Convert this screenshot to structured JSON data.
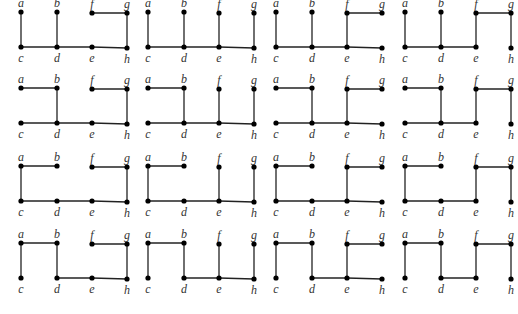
{
  "figure": {
    "rows": 4,
    "cols": 4,
    "node_labels": [
      "a",
      "b",
      "c",
      "d",
      "e",
      "f",
      "g",
      "h"
    ],
    "colors": {
      "edge": "#222222",
      "node": "#000000",
      "label": "#333333",
      "background": "#ffffff"
    }
  },
  "layout": {
    "col_offsets": [
      0,
      127,
      255,
      384
    ],
    "row_offsets": [
      0,
      76,
      154,
      231
    ],
    "node_positions": {
      "a": [
        21,
        12
      ],
      "b": [
        57,
        12
      ],
      "f": [
        92,
        13
      ],
      "g": [
        127,
        13
      ],
      "c": [
        21,
        47
      ],
      "d": [
        57,
        47
      ],
      "e": [
        92,
        47
      ],
      "h": [
        127,
        48
      ]
    }
  },
  "panels": [
    {
      "row": 0,
      "col": 0,
      "edges": [
        [
          "a",
          "c"
        ],
        [
          "b",
          "d"
        ],
        [
          "c",
          "d"
        ],
        [
          "d",
          "e"
        ],
        [
          "e",
          "h"
        ],
        [
          "g",
          "h"
        ],
        [
          "f",
          "g"
        ]
      ]
    },
    {
      "row": 0,
      "col": 1,
      "edges": [
        [
          "a",
          "c"
        ],
        [
          "b",
          "d"
        ],
        [
          "e",
          "f"
        ],
        [
          "g",
          "h"
        ],
        [
          "c",
          "d"
        ],
        [
          "d",
          "e"
        ],
        [
          "e",
          "h"
        ]
      ]
    },
    {
      "row": 0,
      "col": 2,
      "edges": [
        [
          "a",
          "c"
        ],
        [
          "b",
          "d"
        ],
        [
          "e",
          "f"
        ],
        [
          "f",
          "g"
        ],
        [
          "c",
          "d"
        ],
        [
          "d",
          "e"
        ],
        [
          "e",
          "h"
        ]
      ]
    },
    {
      "row": 0,
      "col": 3,
      "edges": [
        [
          "a",
          "c"
        ],
        [
          "b",
          "d"
        ],
        [
          "c",
          "d"
        ],
        [
          "d",
          "e"
        ],
        [
          "e",
          "f"
        ],
        [
          "f",
          "g"
        ],
        [
          "g",
          "h"
        ]
      ]
    },
    {
      "row": 1,
      "col": 0,
      "edges": [
        [
          "a",
          "b"
        ],
        [
          "b",
          "d"
        ],
        [
          "c",
          "d"
        ],
        [
          "d",
          "e"
        ],
        [
          "e",
          "h"
        ],
        [
          "g",
          "h"
        ],
        [
          "f",
          "g"
        ]
      ]
    },
    {
      "row": 1,
      "col": 1,
      "edges": [
        [
          "a",
          "b"
        ],
        [
          "b",
          "d"
        ],
        [
          "c",
          "d"
        ],
        [
          "d",
          "e"
        ],
        [
          "e",
          "f"
        ],
        [
          "e",
          "h"
        ],
        [
          "g",
          "h"
        ]
      ]
    },
    {
      "row": 1,
      "col": 2,
      "edges": [
        [
          "a",
          "b"
        ],
        [
          "b",
          "d"
        ],
        [
          "c",
          "d"
        ],
        [
          "d",
          "e"
        ],
        [
          "e",
          "f"
        ],
        [
          "f",
          "g"
        ],
        [
          "e",
          "h"
        ]
      ]
    },
    {
      "row": 1,
      "col": 3,
      "edges": [
        [
          "a",
          "b"
        ],
        [
          "b",
          "d"
        ],
        [
          "c",
          "d"
        ],
        [
          "d",
          "e"
        ],
        [
          "e",
          "f"
        ],
        [
          "f",
          "g"
        ],
        [
          "g",
          "h"
        ]
      ]
    },
    {
      "row": 2,
      "col": 0,
      "edges": [
        [
          "a",
          "b"
        ],
        [
          "a",
          "c"
        ],
        [
          "c",
          "d"
        ],
        [
          "d",
          "e"
        ],
        [
          "e",
          "h"
        ],
        [
          "g",
          "h"
        ],
        [
          "f",
          "g"
        ]
      ]
    },
    {
      "row": 2,
      "col": 1,
      "edges": [
        [
          "a",
          "b"
        ],
        [
          "a",
          "c"
        ],
        [
          "c",
          "d"
        ],
        [
          "d",
          "e"
        ],
        [
          "e",
          "f"
        ],
        [
          "e",
          "h"
        ],
        [
          "g",
          "h"
        ]
      ]
    },
    {
      "row": 2,
      "col": 2,
      "edges": [
        [
          "a",
          "b"
        ],
        [
          "a",
          "c"
        ],
        [
          "c",
          "d"
        ],
        [
          "d",
          "e"
        ],
        [
          "e",
          "f"
        ],
        [
          "f",
          "g"
        ],
        [
          "e",
          "h"
        ]
      ]
    },
    {
      "row": 2,
      "col": 3,
      "edges": [
        [
          "a",
          "b"
        ],
        [
          "a",
          "c"
        ],
        [
          "c",
          "d"
        ],
        [
          "d",
          "e"
        ],
        [
          "e",
          "f"
        ],
        [
          "f",
          "g"
        ],
        [
          "g",
          "h"
        ]
      ]
    },
    {
      "row": 3,
      "col": 0,
      "edges": [
        [
          "a",
          "b"
        ],
        [
          "a",
          "c"
        ],
        [
          "b",
          "d"
        ],
        [
          "d",
          "e"
        ],
        [
          "e",
          "h"
        ],
        [
          "g",
          "h"
        ],
        [
          "f",
          "g"
        ]
      ]
    },
    {
      "row": 3,
      "col": 1,
      "edges": [
        [
          "a",
          "b"
        ],
        [
          "a",
          "c"
        ],
        [
          "b",
          "d"
        ],
        [
          "d",
          "e"
        ],
        [
          "e",
          "f"
        ],
        [
          "e",
          "h"
        ],
        [
          "g",
          "h"
        ]
      ]
    },
    {
      "row": 3,
      "col": 2,
      "edges": [
        [
          "a",
          "b"
        ],
        [
          "a",
          "c"
        ],
        [
          "b",
          "d"
        ],
        [
          "d",
          "e"
        ],
        [
          "e",
          "f"
        ],
        [
          "f",
          "g"
        ],
        [
          "e",
          "h"
        ]
      ]
    },
    {
      "row": 3,
      "col": 3,
      "edges": [
        [
          "a",
          "b"
        ],
        [
          "a",
          "c"
        ],
        [
          "b",
          "d"
        ],
        [
          "d",
          "e"
        ],
        [
          "e",
          "f"
        ],
        [
          "f",
          "g"
        ],
        [
          "g",
          "h"
        ]
      ]
    }
  ]
}
